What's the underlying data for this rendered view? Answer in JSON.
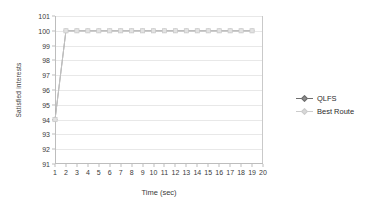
{
  "chart_data": {
    "type": "line",
    "title": "",
    "xlabel": "Time (sec)",
    "ylabel": "Satisfied interests",
    "xlim": [
      1,
      20
    ],
    "ylim": [
      91,
      101
    ],
    "grid": true,
    "legend_position": "right",
    "x": [
      1,
      2,
      3,
      4,
      5,
      6,
      7,
      8,
      9,
      10,
      11,
      12,
      13,
      14,
      15,
      16,
      17,
      18,
      19
    ],
    "xticks": [
      "1",
      "2",
      "3",
      "4",
      "5",
      "6",
      "7",
      "8",
      "9",
      "10",
      "11",
      "12",
      "13",
      "14",
      "15",
      "16",
      "17",
      "18",
      "19",
      "20"
    ],
    "yticks": [
      "91",
      "92",
      "93",
      "94",
      "95",
      "96",
      "97",
      "98",
      "99",
      "100",
      "101"
    ],
    "series": [
      {
        "name": "QLFS",
        "color": "#808080",
        "marker": "diamond",
        "values": [
          94,
          100,
          100,
          100,
          100,
          100,
          100,
          100,
          100,
          100,
          100,
          100,
          100,
          100,
          100,
          100,
          100,
          100,
          100
        ]
      },
      {
        "name": "Best Route",
        "color": "#c8c8c8",
        "marker": "square",
        "values": [
          94,
          100,
          100,
          100,
          100,
          100,
          100,
          100,
          100,
          100,
          100,
          100,
          100,
          100,
          100,
          100,
          100,
          100,
          100
        ]
      }
    ]
  },
  "legend": {
    "items": [
      {
        "label": "QLFS",
        "color": "#6e6e6e",
        "marker_fill": "#8c8c8c"
      },
      {
        "label": "Best Route",
        "color": "#cccccc",
        "marker_fill": "#d8d8d8"
      }
    ]
  }
}
